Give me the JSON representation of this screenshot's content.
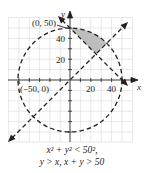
{
  "figure": {
    "type": "region-of-inequalities",
    "origin_label": "",
    "point_labels": [
      {
        "text": "(0, 50)",
        "x": 0,
        "y": 50
      },
      {
        "text": "(−50, 0)",
        "x": -50,
        "y": 0
      }
    ],
    "axis_labels": {
      "x": "x",
      "y": "y"
    },
    "x_ticks": [
      {
        "value": 20,
        "label": "20"
      },
      {
        "value": 40,
        "label": "40"
      }
    ],
    "y_ticks": [
      {
        "value": 20,
        "label": "20"
      },
      {
        "value": 40,
        "label": "40"
      }
    ],
    "grid_step": 10,
    "x_range": [
      -60,
      60
    ],
    "y_range": [
      -60,
      60
    ],
    "curves": [
      {
        "name": "circle",
        "equation": "x^2 + y^2 = 50^2",
        "style": "dashed"
      },
      {
        "name": "line-y-eq-x",
        "equation": "y = x",
        "style": "dashed"
      },
      {
        "name": "line-x-plus-y-eq-50",
        "equation": "x + y = 50",
        "style": "dashed"
      }
    ],
    "shaded_region": {
      "description": "x^2 + y^2 < 50^2, y > x, x + y > 50",
      "fill": "#bdbdbd"
    }
  },
  "caption": {
    "line1": "x² + y² < 50²,",
    "line2": "y > x, x + y > 50"
  },
  "labels": {
    "p_top": "(0, 50)",
    "p_left": "(−50, 0)",
    "tick_x20": "20",
    "tick_x40": "40",
    "tick_y20": "20",
    "tick_y40": "40",
    "axis_x": "x",
    "axis_y": "y"
  }
}
